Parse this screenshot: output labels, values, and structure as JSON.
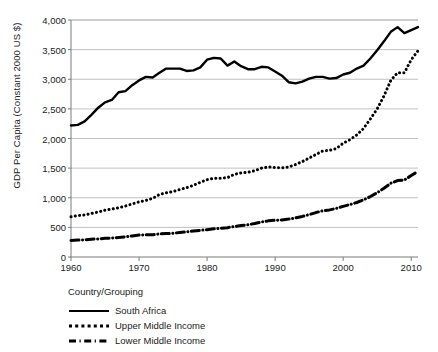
{
  "chart_data": {
    "type": "line",
    "title": "",
    "xlabel": "",
    "ylabel": "GDP Per Capita (Constant 2000 US $)",
    "xlim": [
      1960,
      2011
    ],
    "ylim": [
      0,
      4000
    ],
    "yticks": [
      "0",
      "500",
      "1,000",
      "1,500",
      "2,000",
      "2,500",
      "3,000",
      "3,500",
      "4,000"
    ],
    "ytick_values": [
      0,
      500,
      1000,
      1500,
      2000,
      2500,
      3000,
      3500,
      4000
    ],
    "xticks": [
      "1960",
      "1970",
      "1980",
      "1990",
      "2000",
      "2010"
    ],
    "xtick_values": [
      1960,
      1970,
      1980,
      1990,
      2000,
      2010
    ],
    "grid": "horizontal",
    "legend_position": "below-left",
    "legend_title": "Country/Grouping",
    "x": [
      1960,
      1961,
      1962,
      1963,
      1964,
      1965,
      1966,
      1967,
      1968,
      1969,
      1970,
      1971,
      1972,
      1973,
      1974,
      1975,
      1976,
      1977,
      1978,
      1979,
      1980,
      1981,
      1982,
      1983,
      1984,
      1985,
      1986,
      1987,
      1988,
      1989,
      1990,
      1991,
      1992,
      1993,
      1994,
      1995,
      1996,
      1997,
      1998,
      1999,
      2000,
      2001,
      2002,
      2003,
      2004,
      2005,
      2006,
      2007,
      2008,
      2009,
      2010,
      2011
    ],
    "series": [
      {
        "name": "South Africa",
        "style": "solid",
        "color": "#000000",
        "values": [
          2220,
          2230,
          2290,
          2400,
          2520,
          2610,
          2650,
          2780,
          2800,
          2900,
          2980,
          3040,
          3030,
          3110,
          3180,
          3180,
          3180,
          3140,
          3150,
          3200,
          3330,
          3360,
          3350,
          3230,
          3300,
          3220,
          3170,
          3170,
          3210,
          3200,
          3130,
          3060,
          2950,
          2930,
          2960,
          3010,
          3040,
          3040,
          3010,
          3020,
          3080,
          3110,
          3180,
          3230,
          3350,
          3490,
          3640,
          3800,
          3880,
          3780,
          3830,
          3880
        ]
      },
      {
        "name": "Upper Middle Income",
        "style": "dotted",
        "color": "#000000",
        "values": [
          680,
          700,
          710,
          735,
          760,
          790,
          810,
          830,
          860,
          895,
          930,
          955,
          990,
          1055,
          1085,
          1105,
          1140,
          1170,
          1210,
          1260,
          1305,
          1330,
          1330,
          1340,
          1395,
          1420,
          1430,
          1455,
          1500,
          1520,
          1510,
          1505,
          1520,
          1560,
          1610,
          1670,
          1730,
          1790,
          1800,
          1830,
          1920,
          1980,
          2060,
          2170,
          2330,
          2500,
          2720,
          2980,
          3110,
          3110,
          3330,
          3480
        ]
      },
      {
        "name": "Lower Middle Income",
        "style": "dash-dot",
        "color": "#000000",
        "values": [
          280,
          285,
          290,
          300,
          305,
          315,
          320,
          330,
          340,
          355,
          370,
          375,
          375,
          390,
          395,
          400,
          415,
          425,
          440,
          450,
          460,
          475,
          485,
          495,
          515,
          530,
          545,
          565,
          590,
          610,
          620,
          625,
          640,
          660,
          685,
          715,
          750,
          780,
          795,
          820,
          855,
          885,
          920,
          965,
          1020,
          1085,
          1160,
          1245,
          1290,
          1300,
          1375,
          1445
        ]
      }
    ]
  }
}
